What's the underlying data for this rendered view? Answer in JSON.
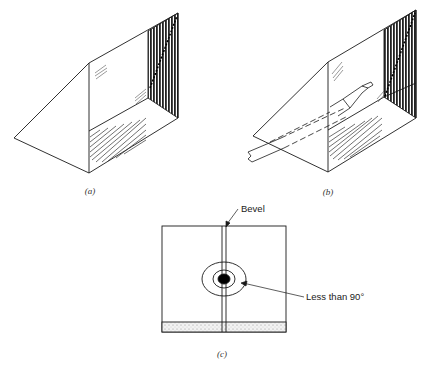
{
  "figure": {
    "panels": [
      {
        "id": "a",
        "caption": "(a)"
      },
      {
        "id": "b",
        "caption": "(b)"
      },
      {
        "id": "c",
        "caption": "(c)"
      }
    ],
    "labels": {
      "bevel": "Bevel",
      "angle": "Less than 90°"
    },
    "colors": {
      "line": "#1a1a1a",
      "dark_face": "#2a2a2a",
      "background": "#ffffff"
    }
  }
}
